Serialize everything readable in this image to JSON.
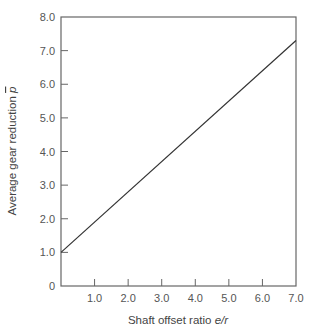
{
  "chart_data": {
    "type": "line",
    "title": "",
    "xlabel": "Shaft offset ratio e/r",
    "xlabel_main": "Shaft offset ratio ",
    "xlabel_italic": "e/r",
    "ylabel": "Average gear reduction p̄",
    "ylabel_main": "Average gear reduction ",
    "ylabel_italic": "p",
    "xlim": [
      0,
      7.0
    ],
    "ylim": [
      0,
      8.0
    ],
    "x_ticks": [
      "1.0",
      "2.0",
      "3.0",
      "4.0",
      "5.0",
      "6.0",
      "7.0"
    ],
    "y_ticks": [
      "0",
      "1.0",
      "2.0",
      "3.0",
      "4.0",
      "5.0",
      "6.0",
      "7.0",
      "8.0"
    ],
    "grid": false,
    "legend": null,
    "series": [
      {
        "name": "Average gear reduction",
        "x": [
          0,
          7.0
        ],
        "y": [
          1.0,
          7.3
        ]
      }
    ],
    "colors": {
      "axis": "#666666",
      "line": "#333333"
    }
  }
}
